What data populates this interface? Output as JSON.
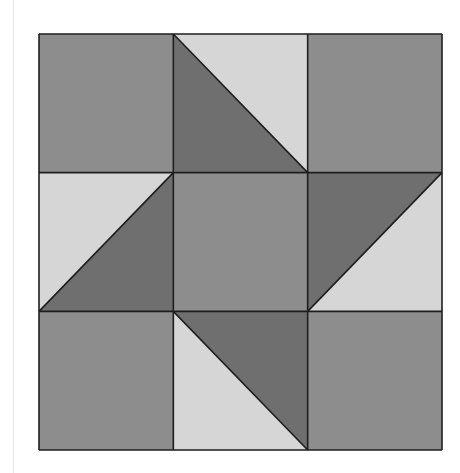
{
  "diagram": {
    "type": "quilt-block",
    "grid": {
      "rows": 3,
      "cols": 3
    },
    "bounds": {
      "x0": 39,
      "y0": 34,
      "x1": 442,
      "y1": 450
    },
    "colors": {
      "medium": "#8d8d8d",
      "dark": "#6f6f6f",
      "light": "#d6d6d6",
      "stroke": "#1e1e1e"
    },
    "cells": [
      {
        "row": 0,
        "col": 0,
        "kind": "solid",
        "fill": "medium"
      },
      {
        "row": 0,
        "col": 1,
        "kind": "half-square",
        "diagonal": "tl-br",
        "upper": "light",
        "lower": "dark"
      },
      {
        "row": 0,
        "col": 2,
        "kind": "solid",
        "fill": "medium"
      },
      {
        "row": 1,
        "col": 0,
        "kind": "half-square",
        "diagonal": "bl-tr",
        "upper": "light",
        "lower": "dark"
      },
      {
        "row": 1,
        "col": 1,
        "kind": "solid",
        "fill": "medium"
      },
      {
        "row": 1,
        "col": 2,
        "kind": "half-square",
        "diagonal": "bl-tr",
        "upper": "dark",
        "lower": "light"
      },
      {
        "row": 2,
        "col": 0,
        "kind": "solid",
        "fill": "medium"
      },
      {
        "row": 2,
        "col": 1,
        "kind": "half-square",
        "diagonal": "tl-br",
        "upper": "dark",
        "lower": "light"
      },
      {
        "row": 2,
        "col": 2,
        "kind": "solid",
        "fill": "medium"
      }
    ]
  }
}
